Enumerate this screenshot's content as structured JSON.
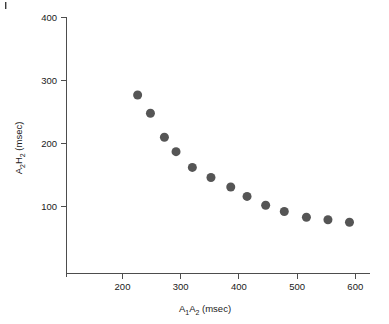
{
  "figure": {
    "background_color": "#ffffff",
    "axis_color": "#4d4d4d",
    "marker_color": "#555555",
    "corner_mark": "|"
  },
  "chart_data": {
    "type": "scatter",
    "title": "",
    "xlabel": "A1A2 (msec)",
    "ylabel": "A2H2 (msec)",
    "xlabel_parts": {
      "pre": "A",
      "sub1": "1",
      "mid": "A",
      "sub2": "2",
      "post": " (msec)"
    },
    "ylabel_parts": {
      "pre": "A",
      "sub1": "2",
      "mid": "H",
      "sub2": "2",
      "post": " (msec)"
    },
    "xlim": [
      120,
      615
    ],
    "ylim": [
      20,
      415
    ],
    "xticks": [
      200,
      300,
      400,
      500,
      600
    ],
    "xtick_labels": [
      "200",
      "300",
      "400",
      "500",
      "600"
    ],
    "yticks": [
      100,
      200,
      300,
      400
    ],
    "ytick_labels": [
      "100",
      "200",
      "300",
      "400"
    ],
    "grid": false,
    "legend": null,
    "marker_size": 9,
    "x": [
      226,
      248,
      272,
      292,
      320,
      352,
      386,
      414,
      446,
      478,
      516,
      553,
      590
    ],
    "y": [
      277,
      248,
      210,
      187,
      162,
      146,
      131,
      116,
      102,
      92,
      83,
      79,
      75
    ],
    "points": [
      {
        "x": 226,
        "y": 277
      },
      {
        "x": 248,
        "y": 248
      },
      {
        "x": 272,
        "y": 210
      },
      {
        "x": 292,
        "y": 187
      },
      {
        "x": 320,
        "y": 162
      },
      {
        "x": 352,
        "y": 146
      },
      {
        "x": 386,
        "y": 131
      },
      {
        "x": 414,
        "y": 116
      },
      {
        "x": 446,
        "y": 102
      },
      {
        "x": 478,
        "y": 92
      },
      {
        "x": 516,
        "y": 83
      },
      {
        "x": 553,
        "y": 79
      },
      {
        "x": 590,
        "y": 75
      }
    ]
  }
}
